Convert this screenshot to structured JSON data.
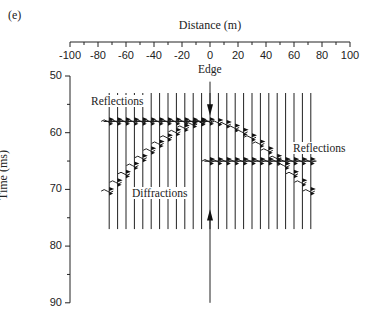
{
  "figure": {
    "panel_label": "(e)",
    "x_axis_title": "Distance (m)",
    "y_axis_title": "Time (ms)",
    "x_ticks": [
      "-100",
      "-80",
      "-60",
      "-40",
      "-20",
      "0",
      "20",
      "40",
      "60",
      "80",
      "100"
    ],
    "y_ticks": [
      "50",
      "60",
      "70",
      "80",
      "90"
    ],
    "annotations": {
      "edge": "Edge",
      "reflections_left": "Reflections",
      "reflections_right": "Reflections",
      "diffractions": "Diffractions"
    }
  },
  "chart_data": {
    "type": "seismic-section",
    "title": "",
    "xlabel": "Distance (m)",
    "ylabel": "Time (ms)",
    "xlim": [
      -100,
      100
    ],
    "ylim": [
      50,
      90
    ],
    "y_inverted": true,
    "traces": {
      "count": 25,
      "x_start": -72,
      "x_end": 72,
      "t_start": 53,
      "t_end": 77
    },
    "events": [
      {
        "name": "Reflections (upper, left of edge)",
        "x_range": [
          -72,
          0
        ],
        "time_ms": 58
      },
      {
        "name": "Reflections (lower, right of edge)",
        "x_range": [
          0,
          72
        ],
        "time_ms": 65
      },
      {
        "name": "Diffractions",
        "apex_x": 0,
        "apex_time_ms": 58,
        "left_end": [
          -72,
          70
        ],
        "right_end": [
          72,
          70.5
        ]
      }
    ],
    "markers": [
      {
        "label": "Edge",
        "x": 0,
        "arrow_from_top_to_ms": 58
      },
      {
        "label": "",
        "x": 0,
        "arrow_from_bottom_to_ms": 73
      }
    ]
  }
}
